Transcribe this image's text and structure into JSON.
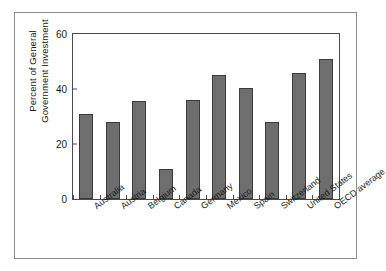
{
  "chart_data": {
    "type": "bar",
    "title": "",
    "xlabel": "",
    "ylabel": "Percent of General Government Investment",
    "ylabel_lines": [
      "Percent of General",
      "Government Investment"
    ],
    "categories": [
      "Australia",
      "Austria",
      "Belgium",
      "Canada",
      "Germany",
      "Mexico",
      "Spain",
      "Switzerland",
      "United States",
      "OECD average"
    ],
    "values": [
      31,
      28,
      35.5,
      11,
      36,
      45,
      40.5,
      28,
      46,
      51
    ],
    "ylim": [
      0,
      60
    ],
    "yticks": [
      0,
      20,
      40,
      60
    ],
    "ytick_labels": [
      "0",
      "20",
      "40",
      "60"
    ],
    "grid": false,
    "legend": false,
    "bar_color": "#6e6e6e",
    "bar_edge_color": "#3b3b3b",
    "axis_color": "#4a4a4a",
    "frame_color": "#8d8d8d",
    "background_color": "#ffffff"
  }
}
